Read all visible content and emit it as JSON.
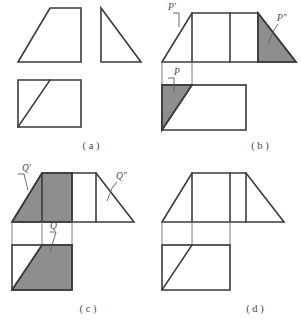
{
  "figure": {
    "line_color": "#3b3b3b",
    "thin_line_color": "#6f6f6f",
    "shade_color": "#8e8e8e",
    "label_color": "#4a4a4a",
    "background": "#ffffff"
  },
  "panels": [
    {
      "id": "a",
      "caption": "( a )",
      "labels": [],
      "description": "Three separate unshaded views: trapezoid, right triangle, and square with diagonal"
    },
    {
      "id": "b",
      "caption": "( b )",
      "labels": [
        {
          "name": "p-prime",
          "text": "P′"
        },
        {
          "name": "p-double-prime",
          "text": "P″"
        },
        {
          "name": "p",
          "text": "P"
        }
      ],
      "description": "Assembled three-view layout with shaded right triangle at upper right and shaded triangle at lower left"
    },
    {
      "id": "c",
      "caption": "( c )",
      "labels": [
        {
          "name": "q-prime",
          "text": "Q′"
        },
        {
          "name": "q-double-prime",
          "text": "Q″"
        },
        {
          "name": "q",
          "text": "Q"
        }
      ],
      "description": "Assembled three-view layout with shaded left trapezoid plus centre rectangle above and shaded lower-right trapezoid below"
    },
    {
      "id": "d",
      "caption": "( d )",
      "labels": [],
      "description": "Assembled three-view layout, no shading and no point labels"
    }
  ]
}
